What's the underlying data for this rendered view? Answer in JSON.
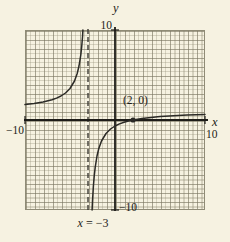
{
  "figure": {
    "labels": {
      "y_var": "y",
      "x_var": "x",
      "y_top": "10",
      "y_bottom": "−10",
      "x_left": "−10",
      "x_right": "10",
      "point": "(2, 0)",
      "asymptote_var": "x",
      "asymptote_rest": " = −3"
    },
    "colors": {
      "background": "#f6f2e1",
      "grid_minor": "#b7b29a",
      "grid_major": "#8f8b76",
      "axis": "#1d1c18",
      "curve": "#2b2a26",
      "asymptote_dash": "#3c3a34"
    }
  },
  "chart_data": {
    "type": "line",
    "title": "",
    "xlabel": "x",
    "ylabel": "y",
    "xlim": [
      -10,
      10
    ],
    "ylim": [
      -10,
      10
    ],
    "grid": true,
    "grid_minor_step": 0.5,
    "grid_major_step": 1,
    "vertical_asymptote_x": -3,
    "asymptote_label": "x = −3",
    "marked_point": [
      2,
      0
    ],
    "marked_point_label": "(2, 0)",
    "axis_tick_labels": {
      "x": [
        -10,
        10
      ],
      "y": [
        -10,
        10
      ]
    },
    "series": [
      {
        "name": "left-branch",
        "points": [
          [
            -10,
            1.714
          ],
          [
            -9,
            1.833
          ],
          [
            -8,
            2.0
          ],
          [
            -7,
            2.25
          ],
          [
            -6.5,
            2.429
          ],
          [
            -6,
            2.667
          ],
          [
            -5.5,
            3.0
          ],
          [
            -5,
            3.5
          ],
          [
            -4.5,
            4.333
          ],
          [
            -4.2,
            5.167
          ],
          [
            -4,
            6.0
          ],
          [
            -3.8,
            7.25
          ],
          [
            -3.7,
            8.143
          ],
          [
            -3.6,
            9.333
          ],
          [
            -3.564,
            10
          ]
        ]
      },
      {
        "name": "right-branch",
        "points": [
          [
            -2.545,
            -10
          ],
          [
            -2.5,
            -9
          ],
          [
            -2.4,
            -7.333
          ],
          [
            -2.3,
            -6.143
          ],
          [
            -2.2,
            -5.25
          ],
          [
            -2,
            -4
          ],
          [
            -1.8,
            -3.167
          ],
          [
            -1.5,
            -2.333
          ],
          [
            -1,
            -1.5
          ],
          [
            -0.5,
            -1.0
          ],
          [
            0,
            -0.667
          ],
          [
            0.5,
            -0.429
          ],
          [
            1,
            -0.25
          ],
          [
            1.5,
            -0.111
          ],
          [
            2,
            0
          ],
          [
            3,
            0.167
          ],
          [
            4,
            0.286
          ],
          [
            5,
            0.375
          ],
          [
            6,
            0.444
          ],
          [
            8,
            0.545
          ],
          [
            10,
            0.615
          ]
        ]
      }
    ]
  }
}
